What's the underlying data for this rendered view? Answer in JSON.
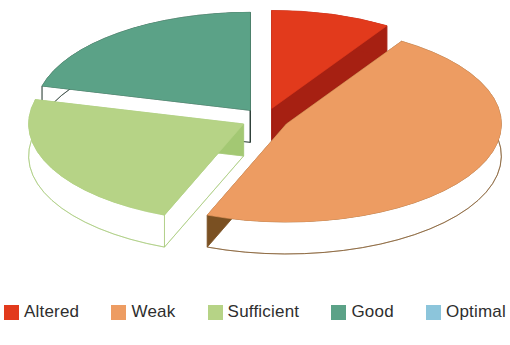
{
  "chart_data": {
    "type": "pie",
    "style": "3d-exploded",
    "title": "",
    "legend_position": "bottom",
    "start_angle_deg": -90,
    "direction": "clockwise",
    "categories": [
      "Altered",
      "Weak",
      "Sufficient",
      "Good",
      "Optimal"
    ],
    "values": [
      9,
      47,
      23,
      21,
      0
    ],
    "unit": "percent",
    "colors": [
      "#e23a1c",
      "#ed9c62",
      "#b6d386",
      "#5ba287",
      "#8cc5db"
    ],
    "side_colors": [
      "#a62012",
      "#7a5022",
      "#a3c873",
      "#1e332a",
      "#6fa8c0"
    ],
    "background_color": "#ffffff",
    "legend_text_color": "#2e2e2e"
  }
}
